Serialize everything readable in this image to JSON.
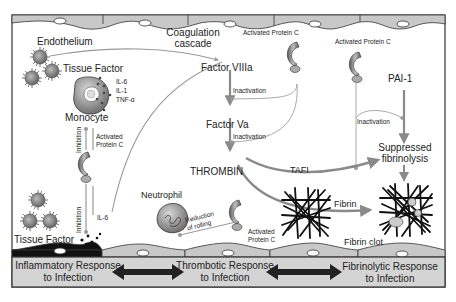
{
  "figure": {
    "labels": {
      "endothelium": "Endothelium",
      "coagulation_cascade_line1": "Coagulation",
      "coagulation_cascade_line2": "cascade",
      "tissue_factor_top": "Tissue Factor",
      "tissue_factor_bottom": "Tissue Factor",
      "cytokines": [
        "IL-6",
        "IL-1",
        "TNF-α"
      ],
      "monocyte": "Monocyte",
      "inhibition_upper": "Inhibition",
      "inhibition_lower": "Inhibition",
      "apc_left_line1": "Activated",
      "apc_left_line2": "Protein C",
      "il6": "IL-6",
      "factor_viiia": "Factor VIIIa",
      "factor_va": "Factor Va",
      "thrombin": "THROMBIN",
      "inactivation_1": "Inactivation",
      "inactivation_2": "Inactivation",
      "inactivation_3": "Inactivation",
      "apc_top_center": "Activated Protein C",
      "apc_top_right": "Activated Protein C",
      "pai1": "PAI-1",
      "suppressed_line1": "Suppressed",
      "suppressed_line2": "fibrinolysis",
      "tafi": "TAFI",
      "fibrin": "Fibrin",
      "fibrin_clot": "Fibrin clot",
      "neutrophil": "Neutrophil",
      "reduction_line1": "Reduction",
      "reduction_line2": "of rolling",
      "apc_bottom_line1": "Activated",
      "apc_bottom_line2": "Protein C"
    },
    "bottom_bar": {
      "inflammatory_line1": "Inflammatory Response",
      "inflammatory_line2": "to Infection",
      "thrombotic_line1": "Thrombotic Response",
      "thrombotic_line2": "to Infection",
      "fibrinolytic_line1": "Fibrinolytic Response",
      "fibrinolytic_line2": "to Infection"
    },
    "colors": {
      "border": "#333333",
      "cell_fill": "#c8c8c8",
      "bar_fill": "#d4d4d4",
      "arrow_gray": "#8a8a8a",
      "dark": "#1a1a1a"
    }
  }
}
